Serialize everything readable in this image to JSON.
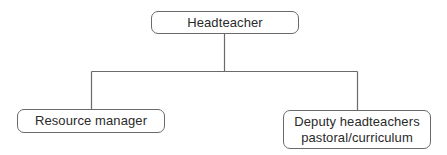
{
  "diagram": {
    "type": "org-chart",
    "nodes": {
      "root": {
        "label": "Headteacher"
      },
      "left": {
        "label": "Resource manager"
      },
      "right": {
        "line1": "Deputy headteachers",
        "line2": "pastoral/curriculum"
      }
    },
    "edges": [
      {
        "from": "Headteacher",
        "to": "Resource manager"
      },
      {
        "from": "Headteacher",
        "to": "Deputy headteachers pastoral/curriculum"
      }
    ],
    "colors": {
      "line": "#6a6a6a",
      "text": "#2a2a2a",
      "background": "#ffffff"
    }
  }
}
